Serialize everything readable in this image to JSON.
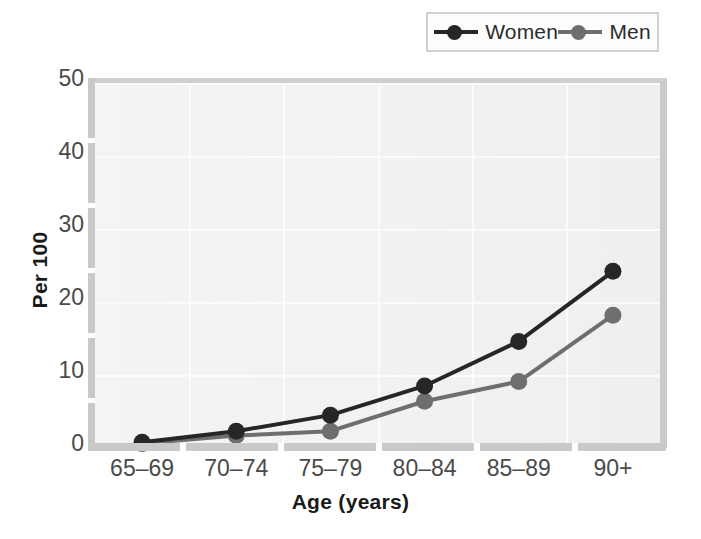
{
  "chart_data": {
    "type": "line",
    "title": "",
    "xlabel": "Age (years)",
    "ylabel": "Per 100",
    "categories": [
      "65–69",
      "70–74",
      "75–79",
      "80–84",
      "85–89",
      "90+"
    ],
    "ylim": [
      0,
      50
    ],
    "yticks": [
      0,
      10,
      20,
      30,
      40,
      50
    ],
    "grid": true,
    "legend_position": "top-right",
    "series": [
      {
        "name": "Women",
        "color": "#262626",
        "values": [
          0.8,
          2.3,
          4.5,
          8.5,
          14.6,
          24.2
        ]
      },
      {
        "name": "Men",
        "color": "#6e6e6e",
        "values": [
          0.6,
          1.7,
          2.3,
          6.4,
          9.1,
          18.2
        ]
      }
    ]
  },
  "legend": {
    "entries": [
      {
        "label": "Women"
      },
      {
        "label": "Men"
      }
    ]
  },
  "axes": {
    "y_title": "Per 100",
    "x_title": "Age (years)",
    "y_tick_labels": [
      "50",
      "40",
      "30",
      "20",
      "10",
      "0"
    ],
    "x_tick_labels": [
      "65–69",
      "70–74",
      "75–79",
      "80–84",
      "85–89",
      "90+"
    ]
  },
  "colors": {
    "women": "#262626",
    "men": "#6e6e6e",
    "plot_background": "#f2f2f2",
    "axis": "#c9c9c9",
    "grid": "#fbfbfb",
    "text": "#4a4a4a"
  }
}
